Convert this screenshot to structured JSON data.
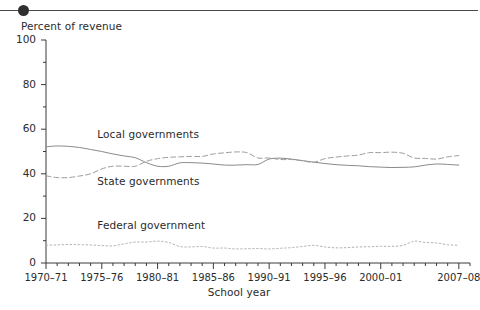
{
  "header": {
    "bullet_icon": "bullet-dot-icon"
  },
  "chart_data": {
    "type": "line",
    "title": "",
    "ylabel": "Percent of revenue",
    "xlabel": "School year",
    "ylim": [
      0,
      100
    ],
    "yticks": [
      0,
      20,
      40,
      60,
      80,
      100
    ],
    "ytick_labels": [
      "0",
      "20",
      "40",
      "60",
      "80",
      "100"
    ],
    "yminor_step": 10,
    "grid": false,
    "legend_position": "inline-annotations",
    "xlim": [
      1970,
      2008
    ],
    "x": [
      1970,
      1971,
      1972,
      1973,
      1974,
      1975,
      1976,
      1977,
      1978,
      1979,
      1980,
      1981,
      1982,
      1983,
      1984,
      1985,
      1986,
      1987,
      1988,
      1989,
      1990,
      1991,
      1992,
      1993,
      1994,
      1995,
      1996,
      1997,
      1998,
      1999,
      2000,
      2001,
      2002,
      2003,
      2004,
      2005,
      2006,
      2007
    ],
    "xticks": [
      1970,
      1975,
      1980,
      1985,
      1990,
      1995,
      2000,
      2007
    ],
    "xtick_labels": [
      "1970–71",
      "1975–76",
      "1980–81",
      "1985–86",
      "1990–91",
      "1995–96",
      "2000–01",
      "2007–08"
    ],
    "series": [
      {
        "name": "Local governments",
        "style": "solid",
        "color": "#8a8a8a",
        "label_x": 1974.6,
        "label_y": 57.5,
        "values": [
          52.1,
          52.5,
          52.3,
          51.8,
          50.9,
          50.0,
          48.9,
          48.0,
          47.2,
          45.0,
          43.4,
          43.4,
          44.9,
          45.0,
          44.8,
          44.4,
          43.9,
          43.9,
          44.1,
          44.2,
          46.6,
          47.0,
          46.6,
          45.9,
          45.2,
          44.6,
          44.1,
          43.8,
          43.6,
          43.2,
          43.0,
          42.8,
          42.9,
          43.1,
          43.9,
          44.4,
          44.2,
          43.9
        ]
      },
      {
        "name": "State governments",
        "style": "dashed",
        "color": "#9c9c9c",
        "label_x": 1974.6,
        "label_y": 36.5,
        "values": [
          39.1,
          38.3,
          38.3,
          39.0,
          40.0,
          42.2,
          43.4,
          43.4,
          43.4,
          45.6,
          46.8,
          47.4,
          47.6,
          47.8,
          47.8,
          48.9,
          49.4,
          49.8,
          49.5,
          47.1,
          47.1,
          46.4,
          46.4,
          45.8,
          45.2,
          46.8,
          47.5,
          48.0,
          48.4,
          49.5,
          49.5,
          49.7,
          49.2,
          47.1,
          46.9,
          46.6,
          47.6,
          48.2
        ]
      },
      {
        "name": "Federal government",
        "style": "dotted",
        "color": "#b0b0b0",
        "label_x": 1974.6,
        "label_y": 16.5,
        "values": [
          8.0,
          8.1,
          8.3,
          8.2,
          8.1,
          7.8,
          7.7,
          8.6,
          9.4,
          9.4,
          9.8,
          9.2,
          7.4,
          7.2,
          7.4,
          6.7,
          6.7,
          6.3,
          6.4,
          6.5,
          6.3,
          6.6,
          6.9,
          7.4,
          7.9,
          7.2,
          6.8,
          6.9,
          7.2,
          7.3,
          7.5,
          7.5,
          7.9,
          9.8,
          9.2,
          9.0,
          8.2,
          7.9
        ]
      }
    ]
  },
  "axis": {
    "y_title": "Percent of revenue",
    "x_title": "School year"
  }
}
